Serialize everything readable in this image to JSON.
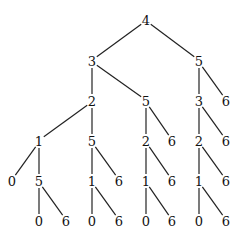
{
  "diagram": {
    "type": "tree",
    "nodes": [
      {
        "id": "n1",
        "label": "4",
        "x": 146,
        "y": 20
      },
      {
        "id": "n2",
        "label": "3",
        "x": 92,
        "y": 61
      },
      {
        "id": "n3",
        "label": "5",
        "x": 199,
        "y": 61
      },
      {
        "id": "n4",
        "label": "2",
        "x": 92,
        "y": 101
      },
      {
        "id": "n5",
        "label": "5",
        "x": 146,
        "y": 101
      },
      {
        "id": "n6",
        "label": "3",
        "x": 199,
        "y": 101
      },
      {
        "id": "n7",
        "label": "6",
        "x": 226,
        "y": 101
      },
      {
        "id": "n8",
        "label": "1",
        "x": 39,
        "y": 141
      },
      {
        "id": "n9",
        "label": "5",
        "x": 92,
        "y": 141
      },
      {
        "id": "n10",
        "label": "2",
        "x": 146,
        "y": 141
      },
      {
        "id": "n11",
        "label": "6",
        "x": 172,
        "y": 141
      },
      {
        "id": "n12",
        "label": "2",
        "x": 199,
        "y": 141
      },
      {
        "id": "n13",
        "label": "6",
        "x": 226,
        "y": 141
      },
      {
        "id": "n14",
        "label": "0",
        "x": 12,
        "y": 181
      },
      {
        "id": "n15",
        "label": "5",
        "x": 39,
        "y": 181
      },
      {
        "id": "n16",
        "label": "1",
        "x": 92,
        "y": 181
      },
      {
        "id": "n17",
        "label": "6",
        "x": 119,
        "y": 181
      },
      {
        "id": "n18",
        "label": "1",
        "x": 146,
        "y": 181
      },
      {
        "id": "n19",
        "label": "6",
        "x": 172,
        "y": 181
      },
      {
        "id": "n20",
        "label": "1",
        "x": 199,
        "y": 181
      },
      {
        "id": "n21",
        "label": "6",
        "x": 226,
        "y": 181
      },
      {
        "id": "n22",
        "label": "0",
        "x": 39,
        "y": 221
      },
      {
        "id": "n23",
        "label": "6",
        "x": 66,
        "y": 221
      },
      {
        "id": "n24",
        "label": "0",
        "x": 92,
        "y": 221
      },
      {
        "id": "n25",
        "label": "6",
        "x": 119,
        "y": 221
      },
      {
        "id": "n26",
        "label": "0",
        "x": 146,
        "y": 221
      },
      {
        "id": "n27",
        "label": "6",
        "x": 172,
        "y": 221
      },
      {
        "id": "n28",
        "label": "0",
        "x": 199,
        "y": 221
      },
      {
        "id": "n29",
        "label": "6",
        "x": 226,
        "y": 221
      }
    ],
    "edges": [
      [
        "n1",
        "n2"
      ],
      [
        "n1",
        "n3"
      ],
      [
        "n2",
        "n4"
      ],
      [
        "n2",
        "n5"
      ],
      [
        "n3",
        "n6"
      ],
      [
        "n3",
        "n7"
      ],
      [
        "n4",
        "n8"
      ],
      [
        "n4",
        "n9"
      ],
      [
        "n5",
        "n10"
      ],
      [
        "n5",
        "n11"
      ],
      [
        "n6",
        "n12"
      ],
      [
        "n6",
        "n13"
      ],
      [
        "n8",
        "n14"
      ],
      [
        "n8",
        "n15"
      ],
      [
        "n9",
        "n16"
      ],
      [
        "n9",
        "n17"
      ],
      [
        "n10",
        "n18"
      ],
      [
        "n10",
        "n19"
      ],
      [
        "n12",
        "n20"
      ],
      [
        "n12",
        "n21"
      ],
      [
        "n15",
        "n22"
      ],
      [
        "n15",
        "n23"
      ],
      [
        "n16",
        "n24"
      ],
      [
        "n16",
        "n25"
      ],
      [
        "n18",
        "n26"
      ],
      [
        "n18",
        "n27"
      ],
      [
        "n20",
        "n28"
      ],
      [
        "n20",
        "n29"
      ]
    ]
  }
}
